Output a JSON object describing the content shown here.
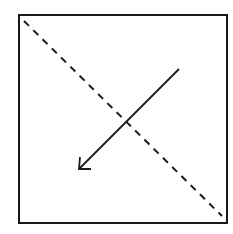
{
  "diagram": {
    "colors": {
      "stroke": "#1a1a1a",
      "background": "#ffffff"
    },
    "square": {
      "x": 19,
      "y": 15,
      "width": 208,
      "height": 208
    },
    "dashed_diagonal": {
      "x1": 24,
      "y1": 21,
      "x2": 222,
      "y2": 216,
      "dash": "7,6"
    },
    "arrow": {
      "x1": 179,
      "y1": 69,
      "x2": 79,
      "y2": 169,
      "direction": "down-left"
    }
  }
}
